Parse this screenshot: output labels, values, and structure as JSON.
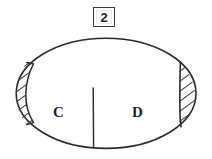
{
  "figure": {
    "number_label": "2",
    "caption": "",
    "background_color": "#ffffff",
    "stroke_color": "#2b2b2b",
    "hatch_color": "#3b3b3b"
  },
  "shape": {
    "kind": "ellipse",
    "center_x": 106,
    "center_y": 93,
    "radius_x": 90,
    "radius_y": 55
  },
  "regions": [
    {
      "id": "left-lune",
      "label": "",
      "fill": "hatched",
      "hatch_direction": "diagonal-up-right",
      "hatch_line_count": 8
    },
    {
      "id": "region-c",
      "label": "C",
      "fill": "white",
      "hatch_direction": "none",
      "hatch_line_count": 0
    },
    {
      "id": "region-d",
      "label": "D",
      "fill": "white",
      "hatch_direction": "none",
      "hatch_line_count": 0
    },
    {
      "id": "right-lune",
      "label": "",
      "fill": "hatched",
      "hatch_direction": "diagonal-up-right",
      "hatch_line_count": 8
    }
  ],
  "dividers": [
    {
      "id": "left-chord",
      "kind": "curved-chord",
      "from_y": 63,
      "to_y": 123
    },
    {
      "id": "center-line",
      "kind": "vertical-line",
      "from_y": 88,
      "to_y": 146
    },
    {
      "id": "right-chord",
      "kind": "vertical-chord",
      "from_y": 62,
      "to_y": 126
    }
  ]
}
